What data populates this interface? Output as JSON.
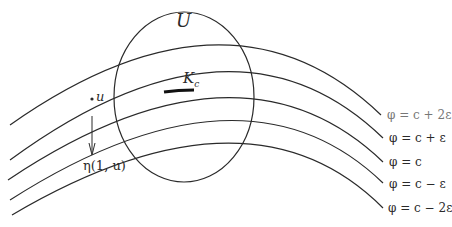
{
  "diagram": {
    "region_label": "U",
    "critical_set_label": "K",
    "critical_set_subscript": "c",
    "point_label": "u",
    "flow_label": "η(1, u)",
    "level_sets": [
      {
        "label": "φ = c + 2ε"
      },
      {
        "label": "φ = c + ε"
      },
      {
        "label": "φ = c"
      },
      {
        "label": "φ = c − ε"
      },
      {
        "label": "φ = c − 2ε"
      }
    ],
    "colors": {
      "stroke": "#2a2a2a",
      "background": "#ffffff"
    }
  }
}
